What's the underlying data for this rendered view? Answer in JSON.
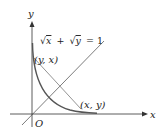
{
  "diagram": {
    "equation": "√x + √y = 1",
    "equation_parts": {
      "sqrt1": "√",
      "x": "x",
      "plus": "+",
      "sqrt2": "√",
      "y": "y",
      "eq": "= 1"
    },
    "axis_x_label": "x",
    "axis_y_label": "y",
    "origin_label": "O",
    "point_upper_label": "(y, x)",
    "point_lower_label": "(x, y)",
    "colors": {
      "axes": "#333333",
      "curve": "#555555",
      "chord": "#888888",
      "diagonal": "#444444",
      "text": "#222222"
    }
  }
}
